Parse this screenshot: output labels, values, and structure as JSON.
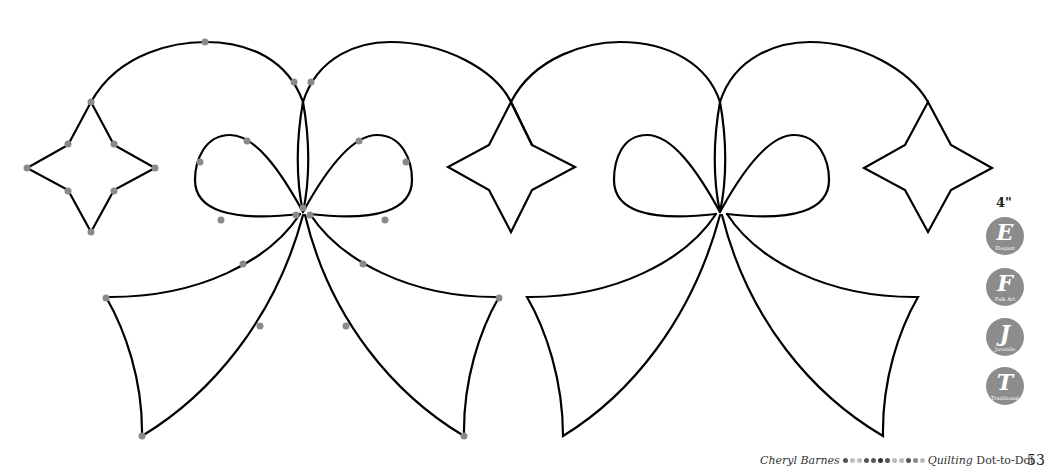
{
  "page": {
    "size_label": "4\"",
    "badges": [
      {
        "letter": "E",
        "caption": "Elegant",
        "top": 217
      },
      {
        "letter": "F",
        "caption": "Folk Art",
        "top": 268
      },
      {
        "letter": "J",
        "caption": "Juvenile",
        "top": 318
      },
      {
        "letter": "T",
        "caption": "Traditional",
        "top": 367
      }
    ],
    "footer": {
      "author": "Cheryl Barnes",
      "book_title_italic": "Quilting",
      "book_title_rest": "Dot-to-Dot",
      "dot_colors": [
        "#555555",
        "#bbbbbb",
        "#bbbbbb",
        "#555555",
        "#555555",
        "#333333",
        "#555555",
        "#bbbbbb",
        "#bbbbbb",
        "#555555",
        "#888888",
        "#bbbbbb"
      ]
    },
    "page_number": "53"
  },
  "pattern": {
    "description": "Quilting border design: two repeating bow motifs with four-point stars, dot-to-dot guide points on the left repeat",
    "stroke_color": "#000000",
    "dot_color": "#8a8a8a"
  }
}
